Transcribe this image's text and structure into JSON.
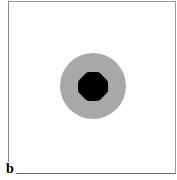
{
  "figure": {
    "panel_label": "b",
    "colors": {
      "background": "#ffffff",
      "outer_circle": "#a8a8a8",
      "inner_disc": "#000000",
      "frame": "#8a8a8a"
    }
  }
}
